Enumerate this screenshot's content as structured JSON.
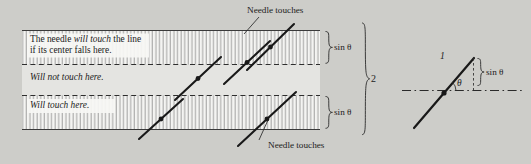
{
  "figure": {
    "title_context": "Buffon's needle problem diagram",
    "background_color": "#cdcdc9",
    "ink_color": "#1c1c1c",
    "band_fill": "#f2f2f0",
    "hatch_color": "#8f8f8f"
  },
  "callouts": {
    "top": "Needle touches",
    "bottom": "Needle touches"
  },
  "bands": {
    "upper_text_line1": "The needle ",
    "upper_text_emph": "will touch",
    "upper_text_line1_end": " the line",
    "upper_text_line2": "if its center falls here.",
    "middle_text": "Will not touch here.",
    "lower_text": "Will touch here."
  },
  "braces": {
    "upper_label": "sin θ",
    "lower_label": "sin θ",
    "outer_label": "2"
  },
  "needle_diagram": {
    "length_label": "1",
    "angle_label": "θ",
    "projection_label": "sin θ"
  }
}
